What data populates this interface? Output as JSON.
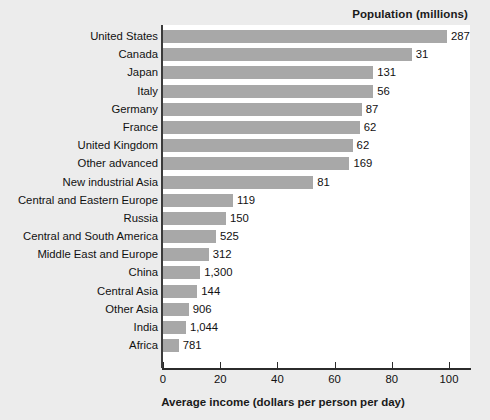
{
  "chart_data": {
    "type": "bar",
    "orientation": "horizontal",
    "title": "",
    "series_title": "Population (millions)",
    "xlabel": "Average income (dollars per person per day)",
    "ylabel": "",
    "xlim": [
      0,
      108
    ],
    "xticks": [
      0,
      20,
      40,
      60,
      80,
      100
    ],
    "xtick_labels": [
      "0",
      "20",
      "40",
      "60",
      "80",
      "100"
    ],
    "grid": false,
    "legend": false,
    "bar_color": "#a8a8a8",
    "plot_background": "#ffffff",
    "figure_background": "#ececec",
    "categories": [
      "United States",
      "Canada",
      "Japan",
      "Italy",
      "Germany",
      "France",
      "United Kingdom",
      "Other advanced",
      "New industrial Asia",
      "Central and Eastern Europe",
      "Russia",
      "Central and South America",
      "Middle East and Europe",
      "China",
      "Central Asia",
      "Other Asia",
      "India",
      "Africa"
    ],
    "values": [
      99.3,
      87.0,
      73.5,
      73.5,
      69.5,
      68.8,
      66.3,
      65.2,
      52.5,
      24.5,
      22.0,
      18.5,
      16.0,
      13.0,
      12.0,
      9.0,
      8.0,
      5.5
    ],
    "value_labels": [
      "287",
      "31",
      "131",
      "56",
      "87",
      "62",
      "62",
      "169",
      "81",
      "119",
      "150",
      "525",
      "312",
      "1,300",
      "144",
      "906",
      "1,044",
      "781"
    ],
    "value_label_meaning": "Population (millions) annotated at the end of each bar",
    "bar_length_meaning": "Average income (dollars per person per day)"
  }
}
